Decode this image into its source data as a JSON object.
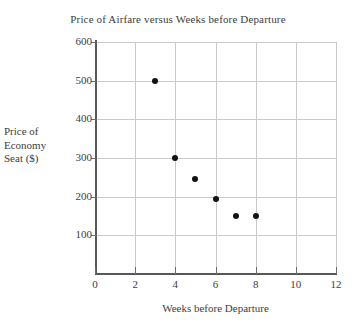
{
  "chart_data": {
    "type": "scatter",
    "title": "Price of Airfare versus Weeks before Departure",
    "xlabel": "Weeks before Departure",
    "ylabel": "Price of Economy Seat ($)",
    "ylabel_lines": [
      "Price of",
      "Economy",
      "Seat ($)"
    ],
    "x": [
      3,
      4,
      5,
      6,
      7,
      8
    ],
    "values": [
      500,
      300,
      245,
      195,
      150,
      150
    ],
    "points": [
      {
        "x": 3,
        "y": 500
      },
      {
        "x": 4,
        "y": 300
      },
      {
        "x": 5,
        "y": 245
      },
      {
        "x": 6,
        "y": 195
      },
      {
        "x": 7,
        "y": 150
      },
      {
        "x": 8,
        "y": 150
      }
    ],
    "xlim": [
      0,
      12
    ],
    "ylim": [
      0,
      600
    ],
    "xticks": [
      0,
      2,
      4,
      6,
      8,
      10,
      12
    ],
    "yticks": [
      100,
      200,
      300,
      400,
      500,
      600
    ],
    "xtick_labels": [
      "0",
      "2",
      "4",
      "6",
      "8",
      "10",
      "12"
    ],
    "ytick_labels": [
      "100",
      "200",
      "300",
      "400",
      "500",
      "600"
    ],
    "grid": true,
    "legend": null,
    "marker_color": "#121212",
    "grid_color": "#c9c9c9",
    "axis_color": "#585858",
    "background_color": "#ffffff"
  }
}
